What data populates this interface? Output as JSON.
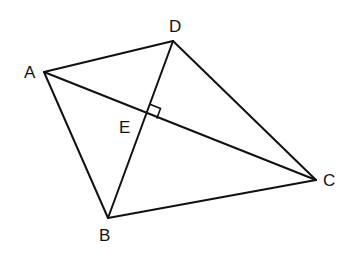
{
  "diagram": {
    "type": "quadrilateral with perpendicular diagonals",
    "points": {
      "A": {
        "label": "A",
        "x": 44,
        "y": 72
      },
      "B": {
        "label": "B",
        "x": 108,
        "y": 218
      },
      "C": {
        "label": "C",
        "x": 316,
        "y": 180
      },
      "D": {
        "label": "D",
        "x": 173,
        "y": 41
      },
      "E": {
        "label": "E",
        "x": 147,
        "y": 114
      }
    },
    "segments": [
      "AD",
      "DC",
      "CB",
      "BA",
      "AC",
      "DB"
    ],
    "annotations": [
      "right angle at E between ED and EC"
    ],
    "stroke_color": "#111111"
  }
}
